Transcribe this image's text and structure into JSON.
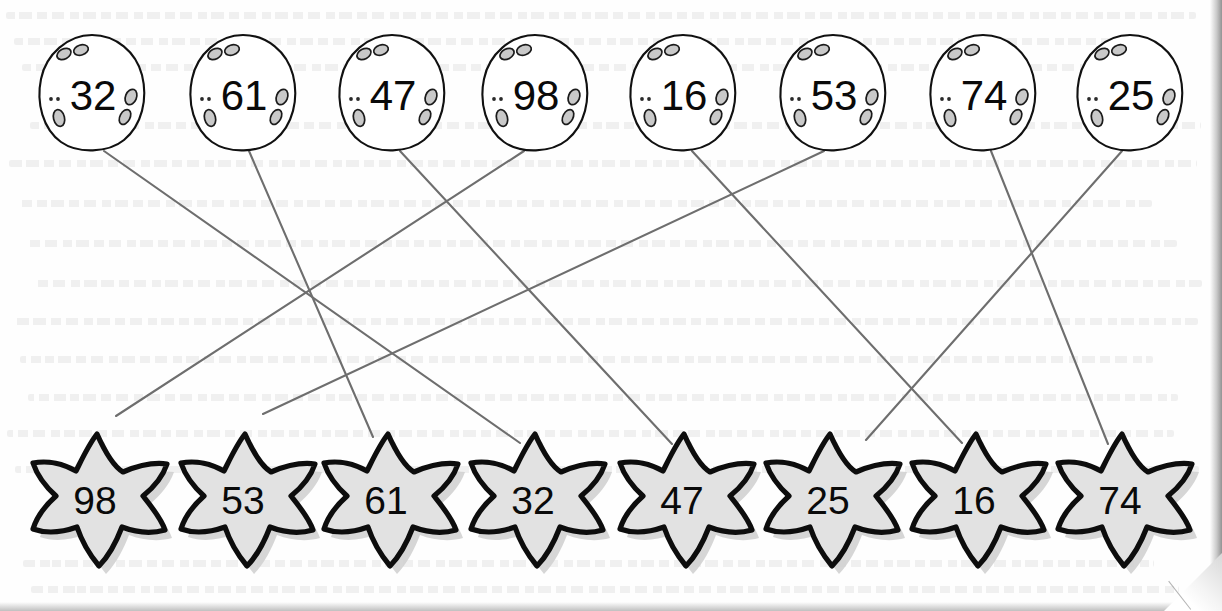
{
  "worksheet": {
    "title": "Number matching worksheet",
    "instruction_visible": false,
    "background_color": "#fefefe",
    "line_color": "#6e6e6e",
    "star_fill_color": "#e2e2e2",
    "star_outline_color": "#0d0d0d",
    "egg_fill_color": "#ffffff",
    "egg_outline_color": "#111111",
    "egg_spot_color": "#c9c9c9"
  },
  "top_row": {
    "shape": "stone-egg",
    "items": [
      {
        "index": 0,
        "label": "32",
        "cx": 92,
        "cy": 93
      },
      {
        "index": 1,
        "label": "61",
        "cx": 243,
        "cy": 93
      },
      {
        "index": 2,
        "label": "47",
        "cx": 392,
        "cy": 93
      },
      {
        "index": 3,
        "label": "98",
        "cx": 535,
        "cy": 93
      },
      {
        "index": 4,
        "label": "16",
        "cx": 683,
        "cy": 93
      },
      {
        "index": 5,
        "label": "53",
        "cx": 833,
        "cy": 93
      },
      {
        "index": 6,
        "label": "74",
        "cx": 983,
        "cy": 93
      },
      {
        "index": 7,
        "label": "25",
        "cx": 1130,
        "cy": 93
      }
    ]
  },
  "bottom_row": {
    "shape": "starfish",
    "items": [
      {
        "index": 0,
        "label": "98",
        "cx": 95,
        "cy": 500
      },
      {
        "index": 1,
        "label": "53",
        "cx": 243,
        "cy": 500
      },
      {
        "index": 2,
        "label": "61",
        "cx": 386,
        "cy": 500
      },
      {
        "index": 3,
        "label": "32",
        "cx": 533,
        "cy": 500
      },
      {
        "index": 4,
        "label": "47",
        "cx": 682,
        "cy": 500
      },
      {
        "index": 5,
        "label": "25",
        "cx": 828,
        "cy": 500
      },
      {
        "index": 6,
        "label": "16",
        "cx": 974,
        "cy": 500
      },
      {
        "index": 7,
        "label": "74",
        "cx": 1120,
        "cy": 500
      }
    ]
  },
  "connections": [
    {
      "from_label": "32",
      "to_label": "32",
      "x1": 104,
      "y1": 151,
      "x2": 520,
      "y2": 443
    },
    {
      "from_label": "61",
      "to_label": "61",
      "x1": 249,
      "y1": 151,
      "x2": 373,
      "y2": 437
    },
    {
      "from_label": "47",
      "to_label": "47",
      "x1": 400,
      "y1": 151,
      "x2": 672,
      "y2": 444
    },
    {
      "from_label": "98",
      "to_label": "98",
      "x1": 524,
      "y1": 151,
      "x2": 116,
      "y2": 416
    },
    {
      "from_label": "16",
      "to_label": "16",
      "x1": 692,
      "y1": 151,
      "x2": 962,
      "y2": 443
    },
    {
      "from_label": "53",
      "to_label": "53",
      "x1": 824,
      "y1": 151,
      "x2": 263,
      "y2": 414
    },
    {
      "from_label": "74",
      "to_label": "74",
      "x1": 991,
      "y1": 151,
      "x2": 1108,
      "y2": 444
    },
    {
      "from_label": "25",
      "to_label": "25",
      "x1": 1122,
      "y1": 151,
      "x2": 866,
      "y2": 440
    }
  ],
  "ghost_text_rows": [
    12,
    38,
    64,
    122,
    160,
    200,
    240,
    280,
    318,
    356,
    394,
    430,
    466,
    560,
    586
  ]
}
